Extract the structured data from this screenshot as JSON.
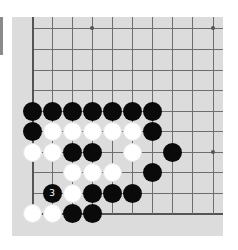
{
  "board": {
    "description": "Go board corner (lower-left region), 10 columns x 10 rows visible",
    "columns_x": [
      32,
      52,
      72,
      92,
      112,
      132,
      152,
      172,
      192,
      213
    ],
    "rows_y": [
      28,
      49,
      70,
      90,
      111,
      131,
      152,
      172,
      193,
      213
    ],
    "edges": {
      "left_col": 0,
      "bottom_row": 9
    },
    "star_points": [
      [
        3,
        0
      ],
      [
        9,
        0
      ],
      [
        9,
        6
      ]
    ],
    "colors": {
      "board": "#dcdcdc",
      "line": "#6e6e6e",
      "black": "#0a0a0a",
      "white": "#ffffff"
    }
  },
  "stones": [
    {
      "color": "black",
      "col": 0,
      "row": 4
    },
    {
      "color": "black",
      "col": 1,
      "row": 4
    },
    {
      "color": "black",
      "col": 2,
      "row": 4
    },
    {
      "color": "black",
      "col": 3,
      "row": 4
    },
    {
      "color": "black",
      "col": 4,
      "row": 4
    },
    {
      "color": "black",
      "col": 5,
      "row": 4
    },
    {
      "color": "black",
      "col": 6,
      "row": 4
    },
    {
      "color": "black",
      "col": 0,
      "row": 5
    },
    {
      "color": "white",
      "col": 1,
      "row": 5
    },
    {
      "color": "white",
      "col": 2,
      "row": 5
    },
    {
      "color": "white",
      "col": 3,
      "row": 5
    },
    {
      "color": "white",
      "col": 4,
      "row": 5
    },
    {
      "color": "white",
      "col": 5,
      "row": 5
    },
    {
      "color": "black",
      "col": 6,
      "row": 5
    },
    {
      "color": "white",
      "col": 0,
      "row": 6
    },
    {
      "color": "white",
      "col": 1,
      "row": 6
    },
    {
      "color": "black",
      "col": 2,
      "row": 6
    },
    {
      "color": "black",
      "col": 3,
      "row": 6
    },
    {
      "color": "white",
      "col": 5,
      "row": 6
    },
    {
      "color": "black",
      "col": 7,
      "row": 6
    },
    {
      "color": "white",
      "col": 2,
      "row": 7
    },
    {
      "color": "white",
      "col": 3,
      "row": 7
    },
    {
      "color": "white",
      "col": 4,
      "row": 7
    },
    {
      "color": "black",
      "col": 6,
      "row": 7
    },
    {
      "color": "black",
      "col": 1,
      "row": 8,
      "label": "3"
    },
    {
      "color": "white",
      "col": 2,
      "row": 8
    },
    {
      "color": "black",
      "col": 3,
      "row": 8
    },
    {
      "color": "black",
      "col": 4,
      "row": 8
    },
    {
      "color": "black",
      "col": 5,
      "row": 8
    },
    {
      "color": "white",
      "col": 0,
      "row": 9
    },
    {
      "color": "white",
      "col": 1,
      "row": 9
    },
    {
      "color": "black",
      "col": 2,
      "row": 9
    },
    {
      "color": "black",
      "col": 3,
      "row": 9
    }
  ]
}
